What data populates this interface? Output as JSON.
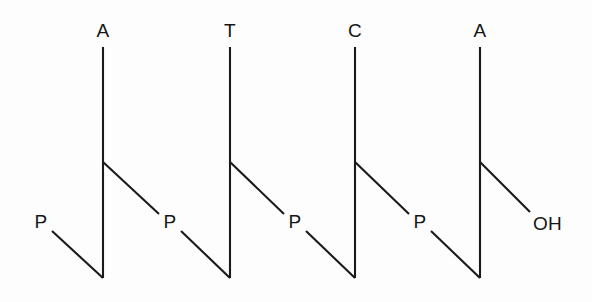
{
  "figure": {
    "background_color": "#fdfdfd",
    "stroke_color": "#1a1a1a",
    "width": 592,
    "height": 302
  },
  "bases": [
    {
      "label": "A",
      "x": 103,
      "label_y": 31,
      "line_top_y": 47,
      "line_bottom_y": 278,
      "branch_y": 162
    },
    {
      "label": "T",
      "x": 230,
      "label_y": 31,
      "line_top_y": 47,
      "line_bottom_y": 278,
      "branch_y": 162
    },
    {
      "label": "C",
      "x": 355,
      "label_y": 31,
      "line_top_y": 47,
      "line_bottom_y": 278,
      "branch_y": 162
    },
    {
      "label": "A",
      "x": 480,
      "label_y": 31,
      "line_top_y": 47,
      "line_bottom_y": 278,
      "branch_y": 162
    }
  ],
  "phosphates": [
    {
      "label": "P",
      "x": 41,
      "y": 221
    },
    {
      "label": "P",
      "x": 170,
      "y": 221
    },
    {
      "label": "P",
      "x": 295,
      "y": 221
    },
    {
      "label": "P",
      "x": 420,
      "y": 221
    }
  ],
  "terminal": {
    "label": "OH",
    "x": 533,
    "y": 223
  },
  "connectors": [
    {
      "name": "leading-phosphate-to-base-1",
      "x1": 52,
      "y1": 231,
      "x2": 103,
      "y2": 278
    },
    {
      "name": "base-1-branch-to-phosphate-2",
      "x1": 103,
      "y1": 162,
      "x2": 159,
      "y2": 214
    },
    {
      "name": "phosphate-2-to-base-2",
      "x1": 181,
      "y1": 231,
      "x2": 230,
      "y2": 278
    },
    {
      "name": "base-2-branch-to-phosphate-3",
      "x1": 230,
      "y1": 162,
      "x2": 284,
      "y2": 214
    },
    {
      "name": "phosphate-3-to-base-3",
      "x1": 306,
      "y1": 231,
      "x2": 355,
      "y2": 278
    },
    {
      "name": "base-3-branch-to-phosphate-4",
      "x1": 355,
      "y1": 162,
      "x2": 409,
      "y2": 214
    },
    {
      "name": "phosphate-4-to-base-4",
      "x1": 431,
      "y1": 231,
      "x2": 480,
      "y2": 278
    },
    {
      "name": "base-4-branch-to-terminal-oh",
      "x1": 480,
      "y1": 162,
      "x2": 530,
      "y2": 212
    }
  ]
}
